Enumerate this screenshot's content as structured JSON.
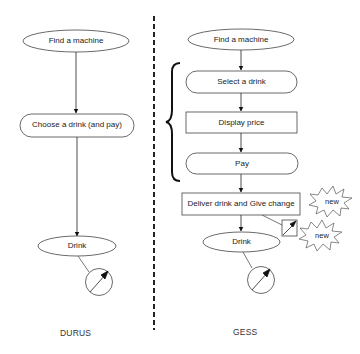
{
  "diagram": {
    "left_column": {
      "title": "DURUS",
      "nodes": [
        {
          "id": "find",
          "shape": "ellipse",
          "label": "Find a machine"
        },
        {
          "id": "choose",
          "shape": "pill",
          "label": "Choose a drink (and pay)"
        },
        {
          "id": "drink",
          "shape": "ellipse",
          "label": "Drink"
        }
      ],
      "meter": {
        "icon": "gauge-icon",
        "attached_to": "drink"
      }
    },
    "right_column": {
      "title": "GESS",
      "nodes": [
        {
          "id": "find",
          "shape": "ellipse",
          "label": "Find a machine"
        },
        {
          "id": "select",
          "shape": "pill",
          "label": "Select a drink"
        },
        {
          "id": "display",
          "shape": "rect",
          "label": "Display price"
        },
        {
          "id": "pay",
          "shape": "pill",
          "label": "Pay"
        },
        {
          "id": "deliver",
          "shape": "rect",
          "label": "Deliver drink and Give change"
        },
        {
          "id": "drink",
          "shape": "ellipse",
          "label": "Drink"
        }
      ],
      "brace": {
        "spans": [
          "select",
          "display",
          "pay"
        ]
      },
      "meters": [
        {
          "icon": "square-gauge-icon",
          "attached_to": "deliver"
        },
        {
          "icon": "gauge-icon",
          "attached_to": "drink"
        }
      ],
      "badges": [
        {
          "label": "new",
          "near": "deliver"
        },
        {
          "label": "new",
          "near": "square-gauge"
        }
      ]
    },
    "separator": "dashed-vertical-line"
  }
}
